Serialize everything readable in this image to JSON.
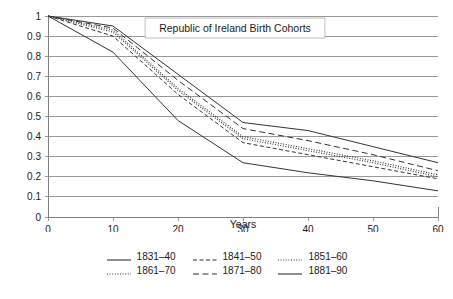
{
  "chart_data": {
    "type": "line",
    "title": "Republic of Ireland Birth Cohorts",
    "xlabel": "Years",
    "ylabel": "",
    "xlim": [
      0,
      60
    ],
    "ylim": [
      0,
      1
    ],
    "grid": "horizontal",
    "legend_position": "bottom",
    "x": [
      0,
      10,
      20,
      30,
      40,
      50,
      60
    ],
    "xticks": [
      "0",
      "10",
      "20",
      "30",
      "40",
      "50",
      "60"
    ],
    "yticks": [
      "0",
      "0.1",
      "0.2",
      "0.3",
      "0.4",
      "0.5",
      "0.6",
      "0.7",
      "0.8",
      "0.9",
      "1"
    ],
    "series": [
      {
        "name": "1831–40",
        "style": "solid",
        "values": [
          1.0,
          0.82,
          0.48,
          0.27,
          0.22,
          0.18,
          0.13
        ]
      },
      {
        "name": "1841–50",
        "style": "dashed",
        "values": [
          1.0,
          0.9,
          0.61,
          0.37,
          0.31,
          0.25,
          0.19
        ]
      },
      {
        "name": "1851–60",
        "style": "dotted",
        "values": [
          1.0,
          0.92,
          0.63,
          0.39,
          0.33,
          0.27,
          0.2
        ]
      },
      {
        "name": "1861–70",
        "style": "dotted",
        "values": [
          1.0,
          0.93,
          0.64,
          0.4,
          0.34,
          0.28,
          0.21
        ]
      },
      {
        "name": "1871–80",
        "style": "dashed-long",
        "values": [
          1.0,
          0.94,
          0.68,
          0.44,
          0.38,
          0.31,
          0.23
        ]
      },
      {
        "name": "1881–90",
        "style": "solid",
        "values": [
          1.0,
          0.95,
          0.71,
          0.47,
          0.43,
          0.35,
          0.27
        ]
      }
    ]
  },
  "legend": {
    "rows": [
      [
        {
          "label": "1831–40",
          "style": "solid"
        },
        {
          "label": "1841–50",
          "style": "dashed"
        },
        {
          "label": "1851–60",
          "style": "dotted"
        }
      ],
      [
        {
          "label": "1861–70",
          "style": "dotted"
        },
        {
          "label": "1871–80",
          "style": "dashed-long"
        },
        {
          "label": "1881–90",
          "style": "solid"
        }
      ]
    ]
  },
  "colors": {
    "line": "#333333",
    "grid": "#808080",
    "axis": "#808080",
    "text": "#1a1a1a",
    "background": "#ffffff"
  }
}
